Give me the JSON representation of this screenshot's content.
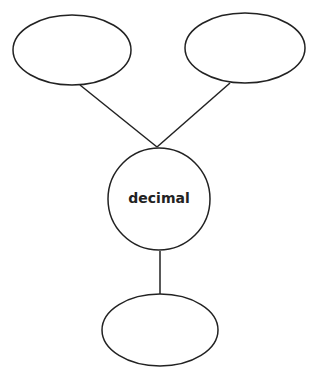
{
  "diagram": {
    "stroke_color": "#222222",
    "background": "#ffffff",
    "center_node": {
      "label": "decimal",
      "shape": "circle"
    },
    "nodes": [
      {
        "id": "top-left",
        "label": "",
        "shape": "ellipse"
      },
      {
        "id": "top-right",
        "label": "",
        "shape": "ellipse"
      },
      {
        "id": "bottom",
        "label": "",
        "shape": "ellipse"
      }
    ],
    "edges": [
      {
        "from": "top-left",
        "to": "center"
      },
      {
        "from": "top-right",
        "to": "center"
      },
      {
        "from": "center",
        "to": "bottom"
      }
    ]
  }
}
